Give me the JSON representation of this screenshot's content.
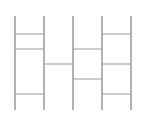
{
  "diagram": {
    "type": "ladder",
    "width": 141,
    "height": 118,
    "line_color": "#9a9a9a",
    "top_y": 16,
    "bottom_y": 110,
    "verticals": [
      15,
      44,
      73,
      102,
      131
    ],
    "rungs": [
      {
        "from": 0,
        "to": 1,
        "y": 34
      },
      {
        "from": 0,
        "to": 1,
        "y": 49
      },
      {
        "from": 0,
        "to": 1,
        "y": 94
      },
      {
        "from": 1,
        "to": 2,
        "y": 64
      },
      {
        "from": 2,
        "to": 3,
        "y": 49
      },
      {
        "from": 2,
        "to": 3,
        "y": 79
      },
      {
        "from": 3,
        "to": 4,
        "y": 34
      },
      {
        "from": 3,
        "to": 4,
        "y": 64
      },
      {
        "from": 3,
        "to": 4,
        "y": 94
      }
    ]
  }
}
